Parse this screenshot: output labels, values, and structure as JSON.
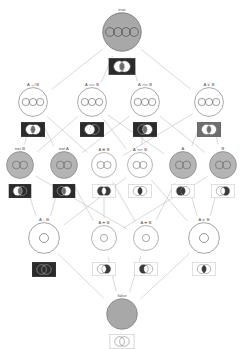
{
  "diagram": {
    "kind": "lattice-hasse-diagram",
    "background_color": "#ffffff",
    "edge_color": "#b9b9b9",
    "node_stroke_color": "#6f6f6f",
    "label_color": "#4a4a4a",
    "venn_box_fill_dark": "#6e6e6e",
    "venn_box_fill_light": "#ffffff",
    "levels": [
      {
        "index": 0,
        "name": "tautology",
        "y": 34
      },
      {
        "index": 1,
        "name": "ternary-disjunctions",
        "y": 104
      },
      {
        "index": 2,
        "name": "literals-and-parity",
        "y": 167
      },
      {
        "index": 3,
        "name": "conjunctions",
        "y": 240
      },
      {
        "index": 4,
        "name": "contradiction",
        "y": 316
      }
    ],
    "nodes": [
      {
        "id": "true",
        "label": "true",
        "x": 122,
        "y": 34,
        "r": 20,
        "fill": "#a8a8a8",
        "subcircles": 4,
        "venn": {
          "x": 122,
          "y": 58,
          "w": 27,
          "h": 17,
          "box": "dark",
          "regions": [
            "a_only",
            "ab",
            "b_only",
            "outside"
          ]
        }
      },
      {
        "id": "a-xor-b-or",
        "label": "A ↮ B",
        "x": 33,
        "y": 104,
        "r": 15,
        "fill": "#ffffff",
        "subcircles": 3,
        "venn": {
          "x": 33,
          "y": 122,
          "w": 24,
          "h": 15,
          "box": "dark",
          "regions": [
            "a_only",
            "b_only",
            "outside"
          ]
        }
      },
      {
        "id": "a-revimp-b",
        "label": "A ⟸ B",
        "x": 92,
        "y": 104,
        "r": 15,
        "fill": "#ffffff",
        "subcircles": 3,
        "venn": {
          "x": 92,
          "y": 122,
          "w": 24,
          "h": 15,
          "box": "dark",
          "regions": [
            "a_only",
            "ab",
            "outside"
          ]
        }
      },
      {
        "id": "a-imp-b",
        "label": "A ⟹ B",
        "x": 145,
        "y": 104,
        "r": 15,
        "fill": "#ffffff",
        "subcircles": 3,
        "venn": {
          "x": 145,
          "y": 122,
          "w": 24,
          "h": 15,
          "box": "dark",
          "regions": [
            "ab",
            "b_only",
            "outside"
          ]
        }
      },
      {
        "id": "a-or-b",
        "label": "A ∨ B",
        "x": 209,
        "y": 104,
        "r": 15,
        "fill": "#ffffff",
        "subcircles": 3,
        "venn": {
          "x": 209,
          "y": 122,
          "w": 24,
          "h": 15,
          "box": "dark",
          "regions": [
            "a_only",
            "ab",
            "b_only"
          ]
        }
      },
      {
        "id": "not-b",
        "label": "not B",
        "x": 20,
        "y": 167,
        "r": 14,
        "fill": "#b4b4b4",
        "subcircles": 2,
        "venn": {
          "x": 20,
          "y": 184,
          "w": 23,
          "h": 14,
          "box": "dark",
          "regions": [
            "a_only",
            "outside"
          ]
        }
      },
      {
        "id": "not-a",
        "label": "not A",
        "x": 64,
        "y": 167,
        "r": 14,
        "fill": "#b4b4b4",
        "subcircles": 2,
        "venn": {
          "x": 64,
          "y": 184,
          "w": 23,
          "h": 14,
          "box": "dark",
          "regions": [
            "b_only",
            "outside"
          ]
        }
      },
      {
        "id": "a-xor-b",
        "label": "A ⊕ B",
        "x": 104,
        "y": 167,
        "r": 13,
        "fill": "#ffffff",
        "subcircles": 2,
        "venn": {
          "x": 104,
          "y": 184,
          "w": 23,
          "h": 14,
          "box": "light",
          "regions": [
            "a_only",
            "b_only"
          ]
        }
      },
      {
        "id": "a-iff-b",
        "label": "A ⟺ B",
        "x": 140,
        "y": 167,
        "r": 13,
        "fill": "#ffffff",
        "subcircles": 2,
        "venn": {
          "x": 140,
          "y": 184,
          "w": 23,
          "h": 14,
          "box": "light",
          "regions": [
            "ab",
            "outside"
          ]
        }
      },
      {
        "id": "a",
        "label": "A",
        "x": 183,
        "y": 167,
        "r": 14,
        "fill": "#b4b4b4",
        "subcircles": 2,
        "venn": {
          "x": 183,
          "y": 184,
          "w": 23,
          "h": 14,
          "box": "light",
          "regions": [
            "a_only",
            "ab"
          ]
        }
      },
      {
        "id": "b",
        "label": "B",
        "x": 223,
        "y": 167,
        "r": 14,
        "fill": "#b4b4b4",
        "subcircles": 2,
        "venn": {
          "x": 223,
          "y": 184,
          "w": 23,
          "h": 14,
          "box": "light",
          "regions": [
            "ab",
            "b_only"
          ]
        }
      },
      {
        "id": "nor",
        "label": "A ↓ B",
        "x": 44,
        "y": 240,
        "r": 16,
        "fill": "#ffffff",
        "subcircles": 1,
        "venn": {
          "x": 44,
          "y": 262,
          "w": 24,
          "h": 15,
          "box": "dark",
          "regions": [
            "outside"
          ]
        }
      },
      {
        "id": "not-a-and-b",
        "label": "A ⇸ B",
        "x": 104,
        "y": 240,
        "r": 13,
        "fill": "#ffffff",
        "subcircles": 1,
        "venn": {
          "x": 104,
          "y": 262,
          "w": 23,
          "h": 14,
          "box": "light",
          "regions": [
            "b_only"
          ]
        }
      },
      {
        "id": "a-and-not-b",
        "label": "A ⇹ B",
        "x": 146,
        "y": 240,
        "r": 13,
        "fill": "#ffffff",
        "subcircles": 1,
        "venn": {
          "x": 146,
          "y": 262,
          "w": 23,
          "h": 14,
          "box": "light",
          "regions": [
            "a_only"
          ]
        }
      },
      {
        "id": "a-and-b",
        "label": "A ∧ B",
        "x": 204,
        "y": 240,
        "r": 16,
        "fill": "#ffffff",
        "subcircles": 1,
        "venn": {
          "x": 204,
          "y": 262,
          "w": 23,
          "h": 14,
          "box": "light",
          "regions": [
            "ab"
          ]
        }
      },
      {
        "id": "false",
        "label": "false",
        "x": 122,
        "y": 316,
        "r": 16,
        "fill": "#a8a8a8",
        "subcircles": 0,
        "venn": {
          "x": 122,
          "y": 334,
          "w": 25,
          "h": 15,
          "box": "light",
          "regions": []
        }
      }
    ],
    "edges": [
      [
        "true",
        "a-xor-b-or"
      ],
      [
        "true",
        "a-revimp-b"
      ],
      [
        "true",
        "a-imp-b"
      ],
      [
        "true",
        "a-or-b"
      ],
      [
        "a-xor-b-or",
        "not-b"
      ],
      [
        "a-xor-b-or",
        "not-a"
      ],
      [
        "a-xor-b-or",
        "a-xor-b"
      ],
      [
        "a-revimp-b",
        "not-b"
      ],
      [
        "a-revimp-b",
        "a-iff-b"
      ],
      [
        "a-revimp-b",
        "a"
      ],
      [
        "a-imp-b",
        "not-a"
      ],
      [
        "a-imp-b",
        "a-iff-b"
      ],
      [
        "a-imp-b",
        "b"
      ],
      [
        "a-or-b",
        "a-xor-b"
      ],
      [
        "a-or-b",
        "a"
      ],
      [
        "a-or-b",
        "b"
      ],
      [
        "not-b",
        "nor"
      ],
      [
        "not-b",
        "a-and-not-b"
      ],
      [
        "not-a",
        "nor"
      ],
      [
        "not-a",
        "not-a-and-b"
      ],
      [
        "a-xor-b",
        "not-a-and-b"
      ],
      [
        "a-xor-b",
        "a-and-not-b"
      ],
      [
        "a-iff-b",
        "nor"
      ],
      [
        "a-iff-b",
        "a-and-b"
      ],
      [
        "a",
        "a-and-not-b"
      ],
      [
        "a",
        "a-and-b"
      ],
      [
        "b",
        "not-a-and-b"
      ],
      [
        "b",
        "a-and-b"
      ],
      [
        "nor",
        "false"
      ],
      [
        "not-a-and-b",
        "false"
      ],
      [
        "a-and-not-b",
        "false"
      ],
      [
        "a-and-b",
        "false"
      ]
    ]
  }
}
